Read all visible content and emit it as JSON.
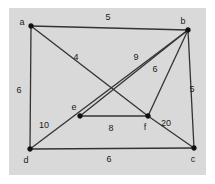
{
  "figure": {
    "kind": "weighted-undirected-graph",
    "background_color": "#d9d9d9",
    "outer_color": "#ffffff",
    "edge_color": "#333333",
    "node_color": "#111111",
    "text_color": "#1a1a1a"
  },
  "nodes": [
    {
      "id": "a",
      "label": "a",
      "x": 31,
      "y": 26,
      "label_x": 22,
      "label_y": 25
    },
    {
      "id": "b",
      "label": "b",
      "x": 188,
      "y": 30,
      "label_x": 183,
      "label_y": 24
    },
    {
      "id": "c",
      "label": "c",
      "x": 194,
      "y": 148,
      "label_x": 193,
      "label_y": 162
    },
    {
      "id": "d",
      "label": "d",
      "x": 30,
      "y": 149,
      "label_x": 26,
      "label_y": 163
    },
    {
      "id": "e",
      "label": "e",
      "x": 80,
      "y": 116,
      "label_x": 74,
      "label_y": 110
    },
    {
      "id": "f",
      "label": "f",
      "x": 148,
      "y": 116,
      "label_x": 145,
      "label_y": 130
    }
  ],
  "edges": [
    {
      "id": "ab",
      "from": "a",
      "to": "b",
      "weight": "5",
      "label_x": 108,
      "label_y": 20
    },
    {
      "id": "ad",
      "from": "a",
      "to": "d",
      "weight": "6",
      "label_x": 19,
      "label_y": 93
    },
    {
      "id": "af",
      "from": "a",
      "to": "f",
      "weight": "4",
      "label_x": 76,
      "label_y": 60
    },
    {
      "id": "be",
      "from": "b",
      "to": "e",
      "weight": "9",
      "label_x": 136,
      "label_y": 60
    },
    {
      "id": "bf",
      "from": "b",
      "to": "f",
      "weight": "6",
      "label_x": 155,
      "label_y": 72
    },
    {
      "id": "bc",
      "from": "b",
      "to": "c",
      "weight": "5",
      "label_x": 192,
      "label_y": 92
    },
    {
      "id": "db",
      "from": "d",
      "to": "b",
      "weight": "10",
      "label_x": 44,
      "label_y": 128
    },
    {
      "id": "ef",
      "from": "e",
      "to": "f",
      "weight": "8",
      "label_x": 111,
      "label_y": 131
    },
    {
      "id": "fc",
      "from": "f",
      "to": "c",
      "weight": "20",
      "label_x": 166,
      "label_y": 126
    },
    {
      "id": "dc",
      "from": "d",
      "to": "c",
      "weight": "6",
      "label_x": 109,
      "label_y": 162
    }
  ]
}
